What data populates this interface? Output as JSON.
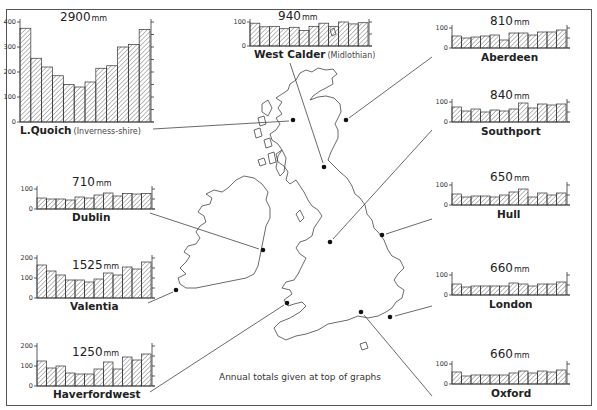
{
  "caption": "Annual totals given at top of graphs",
  "unit": "mm",
  "colors": {
    "ink": "#222222",
    "hatch": "#555555",
    "frame": "#555555",
    "background": "#ffffff"
  },
  "chart_data": {
    "type": "bar",
    "note": "Annual totals given at top of graphs",
    "categories": [
      "Jan",
      "Feb",
      "Mar",
      "Apr",
      "May",
      "Jun",
      "Jul",
      "Aug",
      "Sep",
      "Oct",
      "Nov",
      "Dec"
    ],
    "xlabel": "",
    "ylabel": "Rainfall (mm)",
    "grid": false,
    "series": [
      {
        "name": "L.Quoich",
        "subtitle": "(Inverness-shire)",
        "annual_total": "2900",
        "ylim": [
          0,
          400
        ],
        "yticks": [
          0,
          100,
          200,
          300,
          400
        ],
        "values": [
          375,
          255,
          220,
          185,
          150,
          140,
          160,
          215,
          225,
          300,
          310,
          370
        ]
      },
      {
        "name": "West Calder",
        "subtitle": "(Midlothian)",
        "annual_total": "940",
        "ylim": [
          0,
          100
        ],
        "yticks": [
          0,
          100
        ],
        "values": [
          95,
          80,
          82,
          72,
          78,
          65,
          82,
          95,
          82,
          100,
          92,
          97
        ]
      },
      {
        "name": "Aberdeen",
        "subtitle": "",
        "annual_total": "810",
        "ylim": [
          0,
          100
        ],
        "yticks": [
          0,
          100
        ],
        "values": [
          60,
          50,
          55,
          60,
          65,
          40,
          75,
          75,
          65,
          80,
          80,
          90
        ]
      },
      {
        "name": "Southport",
        "subtitle": "",
        "annual_total": "840",
        "ylim": [
          0,
          100
        ],
        "yticks": [
          0,
          100
        ],
        "values": [
          75,
          55,
          65,
          50,
          60,
          55,
          65,
          95,
          70,
          90,
          85,
          90
        ]
      },
      {
        "name": "Dublin",
        "subtitle": "",
        "annual_total": "710",
        "ylim": [
          0,
          100
        ],
        "yticks": [
          0,
          100
        ],
        "values": [
          55,
          50,
          50,
          45,
          60,
          55,
          70,
          80,
          65,
          78,
          75,
          78
        ]
      },
      {
        "name": "Hull",
        "subtitle": "",
        "annual_total": "650",
        "ylim": [
          0,
          100
        ],
        "yticks": [
          0,
          100
        ],
        "values": [
          55,
          40,
          45,
          45,
          40,
          50,
          65,
          80,
          40,
          60,
          50,
          60
        ]
      },
      {
        "name": "Valentia",
        "subtitle": "",
        "annual_total": "1525",
        "ylim": [
          0,
          200
        ],
        "yticks": [
          0,
          100,
          200
        ],
        "values": [
          165,
          135,
          115,
          90,
          90,
          80,
          95,
          125,
          115,
          155,
          145,
          180
        ]
      },
      {
        "name": "London",
        "subtitle": "",
        "annual_total": "660",
        "ylim": [
          0,
          100
        ],
        "yticks": [
          0,
          100
        ],
        "values": [
          55,
          40,
          45,
          45,
          45,
          45,
          60,
          55,
          45,
          55,
          55,
          65
        ]
      },
      {
        "name": "Haverfordwest",
        "subtitle": "",
        "annual_total": "1250",
        "ylim": [
          0,
          200
        ],
        "yticks": [
          0,
          100,
          200
        ],
        "values": [
          125,
          90,
          100,
          65,
          60,
          60,
          85,
          120,
          85,
          145,
          130,
          160
        ]
      },
      {
        "name": "Oxford",
        "subtitle": "",
        "annual_total": "660",
        "ylim": [
          0,
          100
        ],
        "yticks": [
          0,
          100
        ],
        "values": [
          60,
          40,
          45,
          45,
          45,
          45,
          55,
          65,
          55,
          65,
          60,
          70
        ]
      }
    ]
  },
  "panels": [
    {
      "key": "lquoich",
      "series": 0,
      "x": 20,
      "y": 22,
      "w": 130,
      "h": 100,
      "plotTop": 22,
      "totalX": 60,
      "totalY": 10,
      "labelX": 20,
      "labelY": 124
    },
    {
      "key": "westcalder",
      "series": 1,
      "x": 250,
      "y": 22,
      "w": 118,
      "h": 24,
      "plotTop": 22,
      "totalX": 278,
      "totalY": 9,
      "labelX": 254,
      "labelY": 48
    },
    {
      "key": "aberdeen",
      "series": 2,
      "x": 452,
      "y": 28,
      "w": 114,
      "h": 20,
      "plotTop": 28,
      "totalX": 490,
      "totalY": 14,
      "labelX": 481,
      "labelY": 51
    },
    {
      "key": "southport",
      "series": 3,
      "x": 452,
      "y": 102,
      "w": 114,
      "h": 20,
      "plotTop": 102,
      "totalX": 490,
      "totalY": 88,
      "labelX": 481,
      "labelY": 125
    },
    {
      "key": "dublin",
      "series": 4,
      "x": 37,
      "y": 189,
      "w": 114,
      "h": 20,
      "plotTop": 189,
      "totalX": 72,
      "totalY": 175,
      "labelX": 72,
      "labelY": 211
    },
    {
      "key": "hull",
      "series": 5,
      "x": 452,
      "y": 185,
      "w": 114,
      "h": 20,
      "plotTop": 185,
      "totalX": 490,
      "totalY": 170,
      "labelX": 497,
      "labelY": 208
    },
    {
      "key": "valentia",
      "series": 6,
      "x": 37,
      "y": 258,
      "w": 114,
      "h": 40,
      "plotTop": 258,
      "totalX": 72,
      "totalY": 258,
      "labelX": 70,
      "labelY": 300
    },
    {
      "key": "london",
      "series": 6,
      "x": 452,
      "y": 275,
      "w": 114,
      "h": 20,
      "plotTop": 275,
      "totalX": 490,
      "totalY": 261,
      "labelX": 489,
      "labelY": 298
    },
    {
      "key": "haverfordwest",
      "series": 8,
      "x": 37,
      "y": 346,
      "w": 114,
      "h": 40,
      "plotTop": 346,
      "totalX": 72,
      "totalY": 345,
      "labelX": 53,
      "labelY": 388
    },
    {
      "key": "oxford",
      "series": 9,
      "x": 452,
      "y": 364,
      "w": 114,
      "h": 20,
      "plotTop": 364,
      "totalX": 490,
      "totalY": 347,
      "labelX": 491,
      "labelY": 387
    }
  ]
}
